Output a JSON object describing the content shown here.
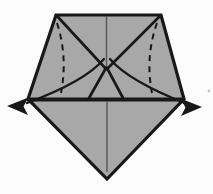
{
  "diagram": {
    "type": "origami-fold-step-diagram",
    "colors": {
      "bg": "#fcfcfc",
      "paper": "#a8a8a8",
      "ink": "#181818",
      "soft": "#565656",
      "speck": "#c6c6c6"
    },
    "paths": {
      "paper_outline": "M 56 15 L 161 15 L 184 99 L 107 179 L 28 99 Z",
      "horizontal_crease": "M 27 99.5 L 185 99.5",
      "center_line_top": "M 106.5 16 L 106.5 68",
      "center_line_bottom": "M 107 102 L 107 172",
      "diagonal_left_upper": "M 57 16 L 106 69",
      "diagonal_right_upper": "M 160 16 L 107 69",
      "diagonal_left_lower": "M 106 68 L 89 98",
      "diagonal_right_lower": "M 107 68 L 123 98",
      "dashed_fold_left": "M 57 23 Q 68 57 61 93",
      "dashed_fold_right": "M 157 23 Q 145 57 152 93",
      "pull_arrow_curve_left": "M 104 59 C 94 71 70 87 27 103",
      "pull_arrow_curve_right": "M 110 59 C 120 71 144 87 187 104",
      "pull_arrow_head_left": "M 7 106 L 28.5 97.5 L 23.5 106.5 L 28 115 Z",
      "pull_arrow_head_right": "M 202 107 L 180.5 98.5 L 185.5 107.5 L 181 116 Z",
      "paper_speck": "M 209 91 m -1.4 0 a 1.4 1.4 0 1 0 2.8 0 a 1.4 1.4 0 1 0 -2.8 0"
    }
  }
}
